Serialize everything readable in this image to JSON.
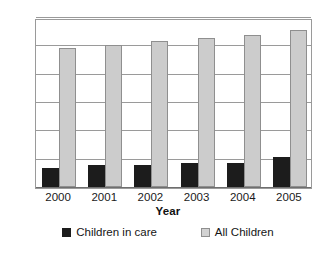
{
  "chart_data": {
    "type": "bar",
    "title": "",
    "subtitle": "",
    "xlabel": "Year",
    "ylabel": "",
    "categories": [
      "2000",
      "2001",
      "2002",
      "2003",
      "2004",
      "2005"
    ],
    "series": [
      {
        "name": "Children in care",
        "color": "#1c1c1c",
        "values": [
          6.8,
          7.6,
          7.6,
          8.6,
          8.6,
          10.5
        ]
      },
      {
        "name": "All Children",
        "color": "#cccccc",
        "values": [
          49,
          50,
          51.5,
          52.5,
          53.5,
          55.5
        ]
      }
    ],
    "ylim": [
      0,
      60
    ],
    "yticks": [
      0,
      10,
      20,
      30,
      40,
      50,
      60
    ],
    "ytick_labels": [
      "0",
      "10",
      "20",
      "30",
      "40",
      "50",
      "60"
    ],
    "grid": true,
    "grid_axis": "y",
    "legend_position": "bottom"
  },
  "legend": {
    "items": [
      {
        "label": "Children in care",
        "swatch": "dark-square-swatch"
      },
      {
        "label": "All Children",
        "swatch": "light-square-swatch"
      }
    ]
  },
  "colors": {
    "children_in_care": "#1c1c1c",
    "all_children": "#cccccc",
    "gridline": "#9a9a9a",
    "axis": "#6e6e6e",
    "text": "#1a1a1a",
    "background": "#ffffff"
  }
}
